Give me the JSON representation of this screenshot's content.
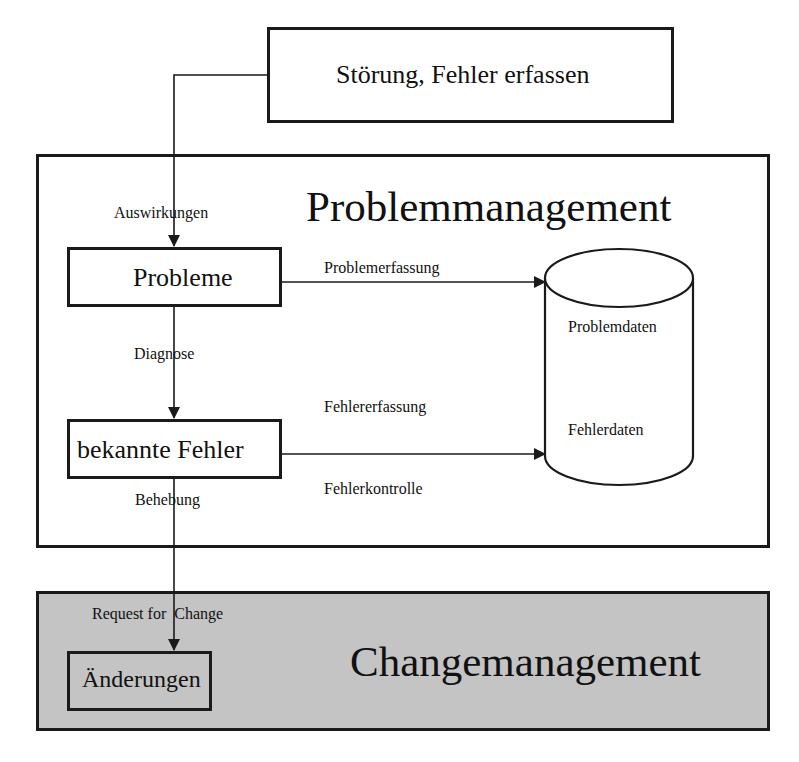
{
  "diagram": {
    "top_box": {
      "label": "Störung, Fehler erfassen"
    },
    "problem_section": {
      "title": "Problemmanagement",
      "nodes": {
        "probleme": "Probleme",
        "bekannte_fehler": "bekannte Fehler"
      },
      "edge_labels": {
        "auswirkungen": "Auswirkungen",
        "diagnose": "Diagnose",
        "behebung": "Behebung",
        "problemerfassung": "Problemerfassung",
        "fehlererfassung": "Fehlererfassung",
        "fehlerkontrolle": "Fehlerkontrolle"
      },
      "database": {
        "shape": "cylinder",
        "items": [
          "Problemdaten",
          "Fehlerdaten"
        ]
      }
    },
    "change_section": {
      "title": "Changemanagement",
      "fill": "#c4c4c4",
      "node": "Änderungen",
      "edge_label": "Request for  Change"
    },
    "colors": {
      "line": "#1a1a1a",
      "background": "#ffffff",
      "change_fill": "#c4c4c4"
    }
  }
}
